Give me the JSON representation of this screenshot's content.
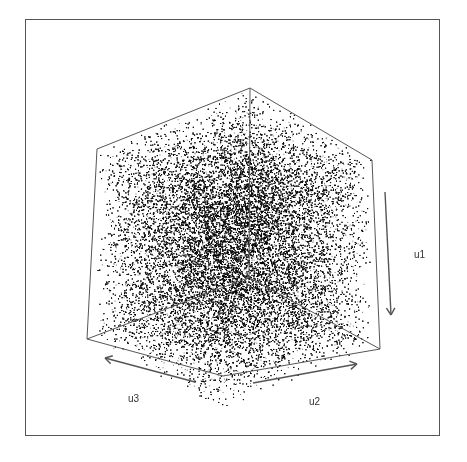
{
  "chart_data": {
    "type": "scatter",
    "subtype": "3d-scatter-cube",
    "title": "",
    "axes": [
      {
        "name": "u1",
        "label": "u1",
        "range": [
          0,
          1
        ],
        "direction": "down"
      },
      {
        "name": "u2",
        "label": "u2",
        "range": [
          0,
          1
        ],
        "direction": "right-up"
      },
      {
        "name": "u3",
        "label": "u3",
        "range": [
          0,
          1
        ],
        "direction": "left-up"
      }
    ],
    "n_points_approx": 60000,
    "point_color": "#000000",
    "grid": false,
    "legend": null
  },
  "geometry": {
    "frame": {
      "left": 25,
      "top": 19,
      "right": 440,
      "bottom": 436
    },
    "cube": {
      "top": [
        250,
        88
      ],
      "upper_left": [
        97,
        149
      ],
      "upper_right": [
        372,
        160
      ],
      "lower_left": [
        87,
        339
      ],
      "lower_right": [
        380,
        349
      ],
      "bottom": [
        223,
        376
      ],
      "inner": [
        250,
        283
      ]
    },
    "arrows": {
      "u1": {
        "from": [
          385,
          192
        ],
        "to": [
          391,
          315
        ]
      },
      "u2": {
        "from": [
          253,
          383
        ],
        "to": [
          357,
          364
        ]
      },
      "u3": {
        "from": [
          195,
          382
        ],
        "to": [
          105,
          358
        ]
      }
    },
    "labels": {
      "u1": [
        414,
        249
      ],
      "u2": [
        309,
        396
      ],
      "u3": [
        128,
        393
      ]
    }
  },
  "labels": {
    "u1": "u1",
    "u2": "u2",
    "u3": "u3"
  }
}
